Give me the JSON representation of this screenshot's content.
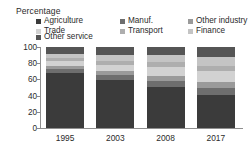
{
  "axis_title": "Percentage",
  "legend": {
    "items": [
      {
        "label": "Agriculture",
        "color": "#3b3b3b"
      },
      {
        "label": "Manuf.",
        "color": "#6e6e6e"
      },
      {
        "label": "Other industry",
        "color": "#9a9a9a"
      },
      {
        "label": "Trade",
        "color": "#d2d2d2"
      },
      {
        "label": "Transport",
        "color": "#aeaeae"
      },
      {
        "label": "Finance",
        "color": "#c4c4c4"
      },
      {
        "label": "Other service",
        "color": "#555555"
      }
    ]
  },
  "chart_data": {
    "type": "bar",
    "title": "",
    "xlabel": "",
    "ylabel": "Percentage",
    "ylim": [
      0,
      100
    ],
    "yticks": [
      0,
      20,
      40,
      60,
      80,
      100
    ],
    "grid": false,
    "stacked": true,
    "legend_position": "top",
    "categories": [
      "1995",
      "2003",
      "2008",
      "2017"
    ],
    "series": [
      {
        "name": "Agriculture",
        "color": "#3b3b3b",
        "values": [
          68,
          59,
          51,
          41
        ]
      },
      {
        "name": "Manuf.",
        "color": "#6e6e6e",
        "values": [
          5,
          6,
          7,
          9
        ]
      },
      {
        "name": "Other industry",
        "color": "#9a9a9a",
        "values": [
          4,
          5,
          6,
          7
        ]
      },
      {
        "name": "Trade",
        "color": "#d2d2d2",
        "values": [
          6,
          8,
          11,
          13
        ]
      },
      {
        "name": "Transport",
        "color": "#aeaeae",
        "values": [
          4,
          5,
          6,
          7
        ]
      },
      {
        "name": "Finance",
        "color": "#c4c4c4",
        "values": [
          5,
          7,
          9,
          11
        ]
      },
      {
        "name": "Other service",
        "color": "#555555",
        "values": [
          8,
          10,
          10,
          12
        ]
      }
    ]
  }
}
